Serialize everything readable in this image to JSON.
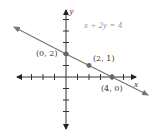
{
  "diagram": {
    "equation": "x + 2y = 4",
    "x_axis_label": "x",
    "y_axis_label": "y",
    "points": [
      {
        "label": "(0, 2)",
        "x": 0,
        "y": 2
      },
      {
        "label": "(2, 1)",
        "x": 2,
        "y": 1
      },
      {
        "label": "(4, 0)",
        "x": 4,
        "y": 0
      }
    ],
    "x_range": [
      -5,
      6
    ],
    "y_range": [
      -4,
      6
    ],
    "colors": {
      "axis": "#333333",
      "line": "#777777",
      "points": "#666666",
      "equation_text": "#9a9a9a"
    }
  }
}
